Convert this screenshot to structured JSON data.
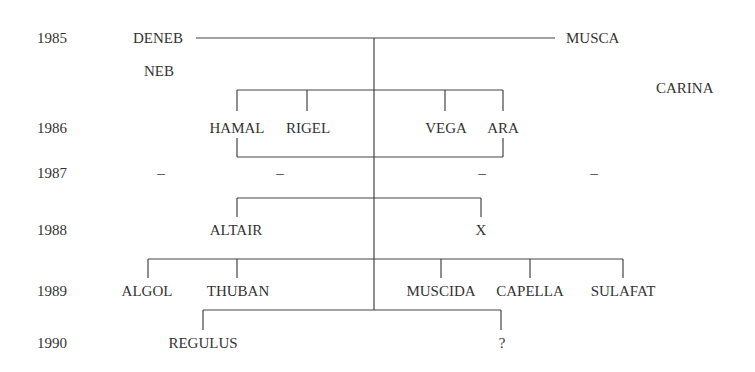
{
  "diagram": {
    "type": "genealogy-tree",
    "line_color": "#444444",
    "years": [
      {
        "label": "1985",
        "y": 31
      },
      {
        "label": "1986",
        "y": 121
      },
      {
        "label": "1987",
        "y": 166
      },
      {
        "label": "1988",
        "y": 223
      },
      {
        "label": "1989",
        "y": 284
      },
      {
        "label": "1990",
        "y": 336
      }
    ],
    "nodes": {
      "deneb": "DENEB",
      "musca": "MUSCA",
      "neb": "NEB",
      "carina": "CARINA",
      "hamal": "HAMAL",
      "rigel": "RIGEL",
      "vega": "VEGA",
      "ara": "ARA",
      "altair": "ALTAIR",
      "x": "X",
      "algol": "ALGOL",
      "thuban": "THUBAN",
      "muscida": "MUSCIDA",
      "capella": "CAPELLA",
      "sulafat": "SULAFAT",
      "regulus": "REGULUS",
      "unknown": "?"
    },
    "dashes_1987": [
      "–",
      "–",
      "–",
      "–"
    ],
    "relations": [
      {
        "parents": [
          "DENEB",
          "MUSCA"
        ],
        "year": "1985",
        "children": [
          "HAMAL",
          "RIGEL",
          "VEGA",
          "ARA"
        ]
      },
      {
        "parents": [
          "HAMAL",
          "ARA"
        ],
        "year": "1987",
        "children": [
          "ALTAIR",
          "X"
        ]
      },
      {
        "parents": [
          "HAMAL",
          "ARA"
        ],
        "year": "1989",
        "children": [
          "ALGOL",
          "THUBAN",
          "MUSCIDA",
          "CAPELLA",
          "SULAFAT"
        ]
      },
      {
        "parents": [
          "HAMAL",
          "ARA"
        ],
        "year": "1990",
        "children": [
          "REGULUS",
          "?"
        ]
      }
    ]
  }
}
